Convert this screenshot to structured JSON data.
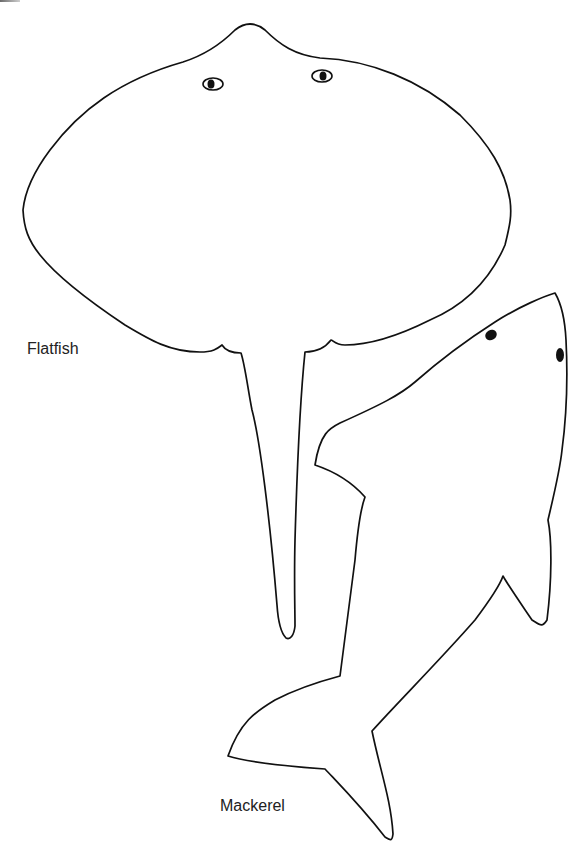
{
  "figure": {
    "stroke_color": "#111111",
    "background": "#ffffff"
  },
  "fish": [
    {
      "id": "flatfish",
      "label": "Flatfish"
    },
    {
      "id": "mackerel",
      "label": "Mackerel"
    }
  ]
}
